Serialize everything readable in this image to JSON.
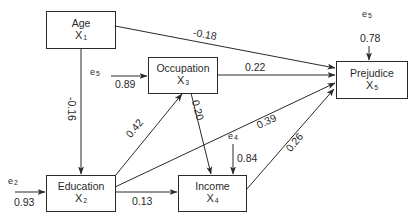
{
  "diagram": {
    "type": "path-analysis",
    "nodes": [
      {
        "id": "age",
        "label": "Age",
        "var": "X",
        "sub": "1"
      },
      {
        "id": "education",
        "label": "Education",
        "var": "X",
        "sub": "2"
      },
      {
        "id": "occupation",
        "label": "Occupation",
        "var": "X",
        "sub": "3"
      },
      {
        "id": "income",
        "label": "Income",
        "var": "X",
        "sub": "4"
      },
      {
        "id": "prejudice",
        "label": "Prejudice",
        "var": "X",
        "sub": "5"
      }
    ],
    "edges": [
      {
        "from": "age",
        "to": "prejudice",
        "coef": "-0.18"
      },
      {
        "from": "age",
        "to": "education",
        "coef": "-0.16"
      },
      {
        "from": "occupation",
        "to": "prejudice",
        "coef": "0.22"
      },
      {
        "from": "occupation",
        "to": "income",
        "coef": "0.20"
      },
      {
        "from": "education",
        "to": "occupation",
        "coef": "0.42"
      },
      {
        "from": "education",
        "to": "prejudice",
        "coef": "0.39"
      },
      {
        "from": "education",
        "to": "income",
        "coef": "0.13"
      },
      {
        "from": "income",
        "to": "prejudice",
        "coef": "0.26"
      }
    ],
    "errors": [
      {
        "id": "e2",
        "name": "e",
        "sub": "2",
        "target": "education",
        "coef": "0.93"
      },
      {
        "id": "e3",
        "name": "e",
        "sub": "5",
        "target": "occupation",
        "coef": "0.89"
      },
      {
        "id": "e4",
        "name": "e",
        "sub": "4",
        "target": "income",
        "coef": "0.84"
      },
      {
        "id": "e5",
        "name": "e",
        "sub": "5",
        "target": "prejudice",
        "coef": "0.78"
      }
    ]
  }
}
